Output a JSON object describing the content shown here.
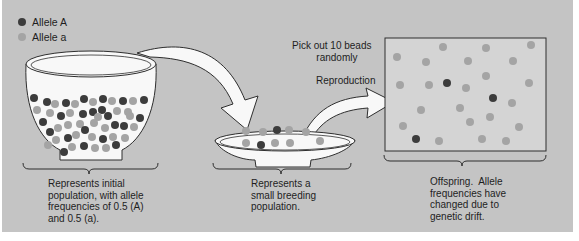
{
  "colors": {
    "background": "#c4c4c4",
    "page_margin": "#ffffff",
    "allele_A": "#3c3c3c",
    "allele_a": "#a4a4a4",
    "vessel_fill": "#f8f8f8",
    "outline": "#2e2e2e",
    "offspring_box_fill": "#d4d4d4"
  },
  "legend": {
    "items": [
      {
        "label": "Allele A",
        "color": "#3c3c3c"
      },
      {
        "label": "Allele a",
        "color": "#a4a4a4"
      }
    ]
  },
  "steps": [
    {
      "id": "initial-population",
      "vessel": "deep bowl",
      "bead_counts": {
        "A": 25,
        "a": 25
      },
      "caption": [
        "Represents initial",
        "population, with allele",
        "frequencies of 0.5 (A)",
        "and 0.5 (a)."
      ]
    },
    {
      "id": "breeding-population",
      "vessel": "shallow dish",
      "bead_counts": {
        "A": 2,
        "a": 8
      },
      "caption": [
        "Represents a",
        "small breeding",
        "population."
      ]
    },
    {
      "id": "offspring",
      "vessel": "rectangular box",
      "bead_counts": {
        "A": 3,
        "a": 22
      },
      "caption": [
        "Offspring.  Allele",
        "frequencies have",
        "changed due to",
        "genetic drift."
      ]
    }
  ],
  "arrows": [
    {
      "from": "initial-population",
      "to": "breeding-population",
      "label": [
        "Pick out 10  beads",
        "randomly"
      ]
    },
    {
      "from": "breeding-population",
      "to": "offspring",
      "label": [
        "Reproduction"
      ]
    }
  ]
}
